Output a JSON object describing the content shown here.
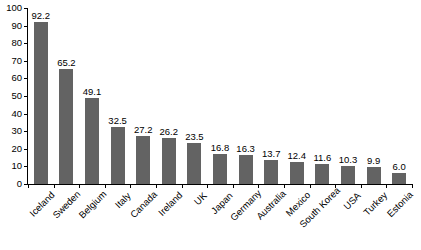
{
  "chart_data": {
    "type": "bar",
    "title": "",
    "subtitle": "",
    "xlabel": "",
    "ylabel": "",
    "ylim": [
      0,
      100
    ],
    "yticks": [
      0,
      10,
      20,
      30,
      40,
      50,
      60,
      70,
      80,
      90,
      100
    ],
    "grid": false,
    "legend": null,
    "orientation": "vertical",
    "bar_color": "#636363",
    "axis_color": "#000000",
    "background": "#ffffff",
    "value_labels": true,
    "xtick_rotation": -45,
    "categories": [
      "Iceland",
      "Sweden",
      "Belgium",
      "Italy",
      "Canada",
      "Ireland",
      "UK",
      "Japan",
      "Germany",
      "Australia",
      "Mexico",
      "South Korea",
      "USA",
      "Turkey",
      "Estonia"
    ],
    "values": [
      92.2,
      65.2,
      49.1,
      32.5,
      27.2,
      26.2,
      23.5,
      16.8,
      16.3,
      13.7,
      12.4,
      11.6,
      10.3,
      9.9,
      6.0
    ],
    "value_labels_text": [
      "92.2",
      "65.2",
      "49.1",
      "32.5",
      "27.2",
      "26.2",
      "23.5",
      "16.8",
      "16.3",
      "13.7",
      "12.4",
      "11.6",
      "10.3",
      "9.9",
      "6.0"
    ],
    "ytick_labels": [
      "0",
      "10",
      "20",
      "30",
      "40",
      "50",
      "60",
      "70",
      "80",
      "90",
      "100"
    ]
  }
}
